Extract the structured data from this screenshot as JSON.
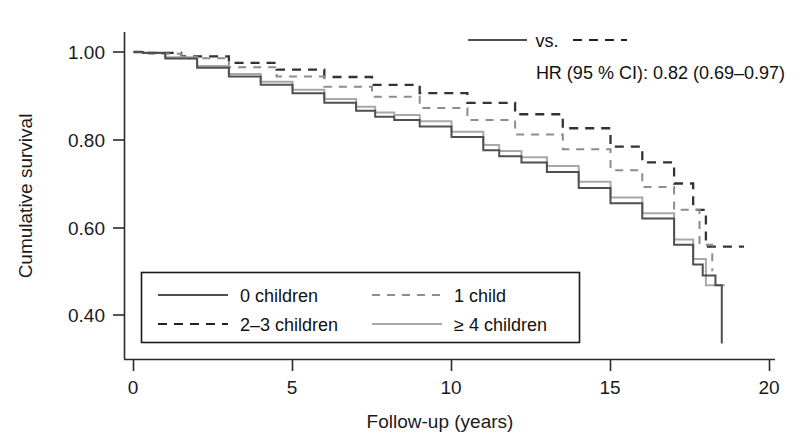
{
  "chart_data": {
    "type": "line",
    "title": "",
    "xlabel": "Follow-up (years)",
    "ylabel": "Cumulative survival",
    "xlim": [
      0,
      20
    ],
    "ylim": [
      0.3,
      1.04
    ],
    "xticks": [
      0,
      5,
      10,
      15,
      20
    ],
    "xticklabels": [
      "0",
      "5",
      "10",
      "15",
      "20"
    ],
    "yticks": [
      0.4,
      0.6,
      0.8,
      1.0
    ],
    "yticklabels": [
      "0.40",
      "0.60",
      "0.80",
      "1.00"
    ],
    "grid": false,
    "legend_position": "lower-left-inset",
    "series": [
      {
        "name": "0 children",
        "style": "solid-dark",
        "x": [
          0,
          0.3,
          1.0,
          2.0,
          3.0,
          4.0,
          5.0,
          6.0,
          7.0,
          7.6,
          8.2,
          9.0,
          10.0,
          11.0,
          11.5,
          12.2,
          13.0,
          14.0,
          15.0,
          16.0,
          17.0,
          17.6,
          17.9,
          18.3,
          18.5
        ],
        "y": [
          1.0,
          0.998,
          0.985,
          0.964,
          0.944,
          0.925,
          0.906,
          0.884,
          0.866,
          0.852,
          0.845,
          0.83,
          0.806,
          0.776,
          0.762,
          0.748,
          0.726,
          0.69,
          0.655,
          0.62,
          0.56,
          0.515,
          0.49,
          0.468,
          0.335
        ]
      },
      {
        "name": "1 child",
        "style": "dashed-light",
        "x": [
          0,
          0.5,
          1.5,
          3.0,
          4.5,
          6.0,
          7.5,
          9.0,
          10.5,
          12.0,
          13.5,
          15.0,
          16.0,
          17.0,
          17.8,
          18.2
        ],
        "y": [
          1.0,
          0.996,
          0.986,
          0.965,
          0.944,
          0.921,
          0.898,
          0.872,
          0.845,
          0.812,
          0.778,
          0.73,
          0.692,
          0.64,
          0.56,
          0.5
        ]
      },
      {
        "name": "2–3 children",
        "style": "dashed-dark",
        "x": [
          0,
          0.5,
          1.5,
          3.0,
          4.5,
          6.0,
          7.5,
          9.0,
          10.5,
          12.0,
          13.5,
          15.0,
          16.0,
          17.0,
          17.6,
          18.0,
          19.2
        ],
        "y": [
          1.0,
          0.998,
          0.99,
          0.975,
          0.96,
          0.943,
          0.925,
          0.906,
          0.884,
          0.858,
          0.826,
          0.784,
          0.748,
          0.7,
          0.64,
          0.556,
          0.556
        ]
      },
      {
        "name": "≥ 4 children",
        "style": "solid-light",
        "x": [
          0,
          0.3,
          1.0,
          2.0,
          3.0,
          4.0,
          5.0,
          6.0,
          7.0,
          7.6,
          8.2,
          9.0,
          10.0,
          11.0,
          11.5,
          12.2,
          13.0,
          14.0,
          15.0,
          16.0,
          17.0,
          17.6,
          18.0,
          18.6
        ],
        "y": [
          1.0,
          0.999,
          0.988,
          0.968,
          0.95,
          0.932,
          0.914,
          0.893,
          0.875,
          0.862,
          0.856,
          0.842,
          0.818,
          0.788,
          0.774,
          0.76,
          0.74,
          0.704,
          0.668,
          0.632,
          0.572,
          0.528,
          0.468,
          0.468
        ]
      }
    ],
    "annotation": {
      "comparison_label": "vs.",
      "comparison_left_style": "solid-dark",
      "comparison_right_style": "dashed-dark",
      "hr_text": "HR (95 % CI): 0.82 (0.69–0.97)"
    },
    "legend_entries": [
      {
        "label": "0 children",
        "style": "solid-dark"
      },
      {
        "label": "1 child",
        "style": "dashed-light"
      },
      {
        "label": "2–3 children",
        "style": "dashed-dark"
      },
      {
        "label": "≥ 4 children",
        "style": "solid-light"
      }
    ]
  },
  "colors": {
    "solid_dark": "#4f4f4f",
    "solid_light": "#a8a8a8",
    "dashed_dark": "#333333",
    "dashed_light": "#8d8d8d",
    "axis": "#2a2a2a",
    "text": "#1a1a1a",
    "background": "#ffffff"
  }
}
